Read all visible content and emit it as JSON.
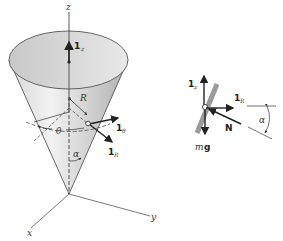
{
  "figure": {
    "cone": {
      "axes": {
        "x_label": "x",
        "y_label": "y",
        "z_label": "z"
      },
      "unit_vectors": {
        "z": {
          "symbol": "1",
          "subscript": "z"
        },
        "theta": {
          "symbol": "1",
          "subscript": "θ"
        },
        "R": {
          "symbol": "1",
          "subscript": "R"
        }
      },
      "labels": {
        "radius": "R",
        "azimuth": "θ",
        "half_angle": "α"
      }
    },
    "free_body": {
      "unit_vectors": {
        "z": {
          "symbol": "1",
          "subscript": "z"
        },
        "R": {
          "symbol": "1",
          "subscript": "R"
        }
      },
      "forces": {
        "normal": "N",
        "weight_m": "m",
        "weight_g": "g"
      },
      "angle_label": "α"
    },
    "colors": {
      "cone_fill_light": "#e8e8e8",
      "cone_fill_dark": "#b8b8b8",
      "line": "#333333",
      "wall": "#9a9a9a"
    }
  }
}
